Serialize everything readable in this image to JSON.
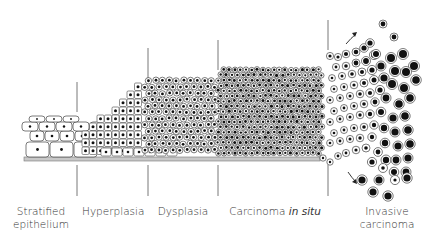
{
  "stages": [
    {
      "id": "stratified",
      "label_lines": [
        "Stratified",
        "epithelium"
      ]
    },
    {
      "id": "hyperplasia",
      "label_lines": [
        "Hyperplasia"
      ]
    },
    {
      "id": "dysplasia",
      "label_lines": [
        "Dysplasia"
      ]
    },
    {
      "id": "cis",
      "label_main": "Carcinoma ",
      "label_italic": "in situ"
    },
    {
      "id": "invasive",
      "label_lines": [
        "Invasive",
        "carcinoma"
      ]
    }
  ],
  "colors": {
    "line": "#555555",
    "membrane_fill": "#c8c8c8",
    "membrane_stroke": "#777777",
    "cell_stroke": "#444444",
    "nucleus": "#111111"
  }
}
